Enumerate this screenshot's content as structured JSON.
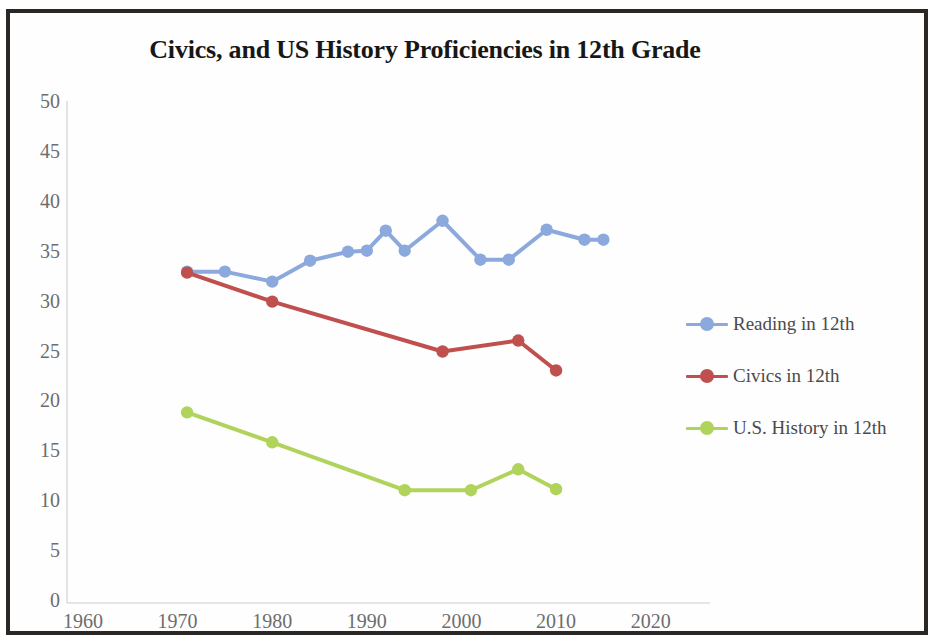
{
  "chart_data": {
    "type": "line",
    "title": "Civics, and US History Proficiencies in 12th Grade",
    "xlabel": "",
    "ylabel": "",
    "xlim": [
      1960,
      2025
    ],
    "ylim": [
      0,
      50
    ],
    "grid": false,
    "legend_position": "right",
    "x_ticks": [
      "1960",
      "1970",
      "1980",
      "1990",
      "2000",
      "2010",
      "2020"
    ],
    "y_ticks": [
      "50",
      "45",
      "40",
      "35",
      "30",
      "25",
      "20",
      "15",
      "10",
      "5",
      "0"
    ],
    "series": [
      {
        "name": "Reading in 12th",
        "color": "#8ca9dd",
        "x": [
          1971,
          1975,
          1980,
          1984,
          1988,
          1990,
          1992,
          1994,
          1998,
          2002,
          2005,
          2009,
          2013,
          2015
        ],
        "values": [
          33.1,
          33.1,
          32.1,
          34.2,
          35.1,
          35.2,
          37.2,
          35.2,
          38.2,
          34.3,
          34.3,
          37.3,
          36.3,
          36.3
        ]
      },
      {
        "name": "Civics in 12th",
        "color": "#c0504d",
        "x": [
          1971,
          1980,
          1998,
          2006,
          2010
        ],
        "values": [
          33.0,
          30.1,
          25.1,
          26.2,
          23.2
        ]
      },
      {
        "name": "U.S. History in 12th",
        "color": "#b0d35c",
        "x": [
          1971,
          1980,
          1994,
          2001,
          2006,
          2010
        ],
        "values": [
          19.0,
          16.0,
          11.2,
          11.2,
          13.3,
          11.3
        ]
      }
    ]
  },
  "legend": {
    "items": [
      {
        "label": "Reading in 12th",
        "color": "#8ca9dd"
      },
      {
        "label": "Civics in 12th",
        "color": "#c0504d"
      },
      {
        "label": "U.S. History in 12th",
        "color": "#b0d35c"
      }
    ]
  },
  "colors": {
    "reading": "#8ca9dd",
    "civics": "#c0504d",
    "us_history": "#b0d35c",
    "axis": "#d9d9d9",
    "tick_text": "#6d6d6d",
    "title": "#171717",
    "frame": "#2b2724"
  }
}
